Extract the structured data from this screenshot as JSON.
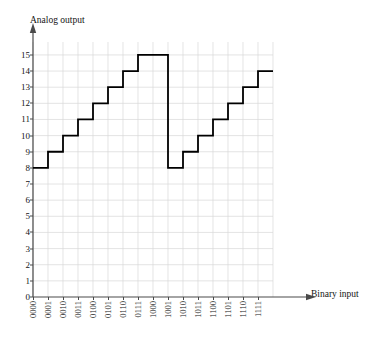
{
  "figure": {
    "y_axis_title": "Analog output",
    "x_axis_title": "Binary input"
  },
  "chart_data": {
    "type": "line",
    "title": "",
    "subtitle": "",
    "xlabel": "Binary input",
    "ylabel": "Analog output",
    "style": "staircase / step (DAC transfer characteristic with major carry glitch)",
    "categories": [
      "0000",
      "0001",
      "0010",
      "0011",
      "0100",
      "0101",
      "0110",
      "0111",
      "1000",
      "1001",
      "1010",
      "1011",
      "1100",
      "1101",
      "1110",
      "1111"
    ],
    "values": [
      8,
      9,
      10,
      11,
      12,
      13,
      14,
      15,
      15,
      8,
      9,
      10,
      11,
      12,
      13,
      14
    ],
    "step_plateaus": [
      {
        "binary": "0000",
        "value": 8
      },
      {
        "binary": "0001",
        "value": 9
      },
      {
        "binary": "0010",
        "value": 10
      },
      {
        "binary": "0011",
        "value": 11
      },
      {
        "binary": "0100",
        "value": 12
      },
      {
        "binary": "0101",
        "value": 13
      },
      {
        "binary": "0110",
        "value": 14
      },
      {
        "binary": "0111",
        "value": 15
      },
      {
        "binary": "1000",
        "value": 8
      },
      {
        "binary": "1001",
        "value": 9
      },
      {
        "binary": "1010",
        "value": 10
      },
      {
        "binary": "1011",
        "value": 11
      },
      {
        "binary": "1100",
        "value": 12
      },
      {
        "binary": "1101",
        "value": 13
      },
      {
        "binary": "1110",
        "value": 14
      },
      {
        "binary": "1111",
        "value": 15
      }
    ],
    "xlim": [
      0,
      16
    ],
    "ylim": [
      0,
      15.8
    ],
    "ytick_labels": [
      "0",
      "1",
      "2",
      "3",
      "4",
      "5",
      "6",
      "7",
      "8",
      "9",
      "10",
      "11",
      "12",
      "13",
      "14",
      "15"
    ],
    "ytick_values": [
      0,
      1,
      2,
      3,
      4,
      5,
      6,
      7,
      8,
      9,
      10,
      11,
      12,
      13,
      14,
      15
    ],
    "grid": true,
    "grid_color": "#d8d8d8",
    "legend": "none",
    "line_color": "#000000",
    "line_width": 1.8,
    "axis_color": "#4a4a4a",
    "axis_arrows": true
  }
}
